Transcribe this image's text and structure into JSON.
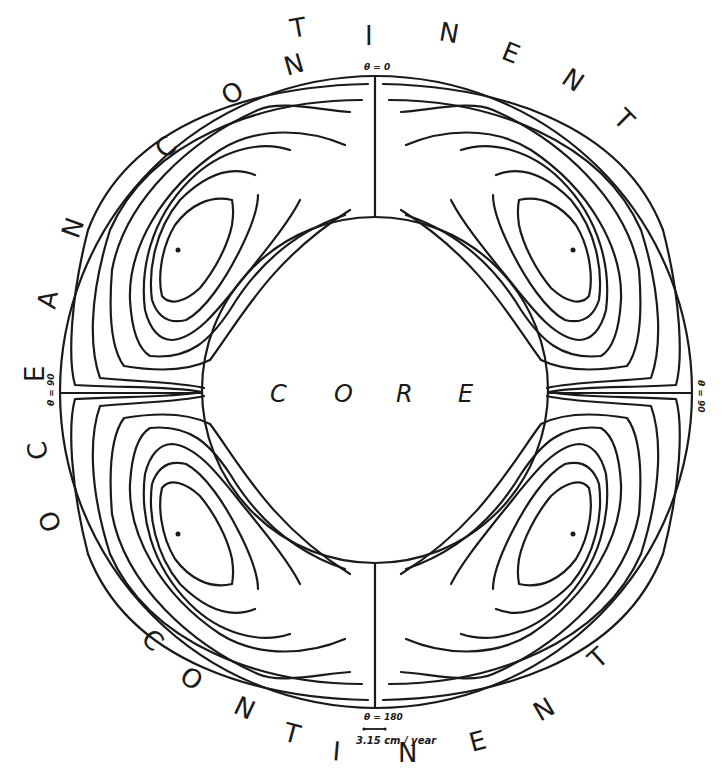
{
  "figure": {
    "type": "mantle convection streamline diagram",
    "center_label": "CORE",
    "center_letters": [
      "C",
      "O",
      "R",
      "E"
    ],
    "ring_labels": {
      "top": "CONTINENT",
      "left": "OCEAN",
      "bottom": "CONTINENT",
      "bottom_right_letters": [
        "N",
        "E",
        "N",
        "T"
      ],
      "top_right_letters": [
        "N",
        "E",
        "N",
        "T"
      ]
    },
    "top_letters": [
      "C",
      "O",
      "N",
      "T",
      "I",
      "N",
      "E",
      "N",
      "T"
    ],
    "left_letters": [
      "O",
      "C",
      "E",
      "A",
      "N"
    ],
    "bottom_letters": [
      "C",
      "O",
      "N",
      "T",
      "I",
      "N",
      "E",
      "N",
      "T"
    ],
    "angle_labels": {
      "top": "θ = 0",
      "left": "θ = 90",
      "right": "θ = 90",
      "bottom": "θ = 180"
    },
    "scale_bar": "3.15 cm / year",
    "cells": 4,
    "colors": {
      "ink": "#1a1a1a",
      "background": "#ffffff"
    }
  }
}
